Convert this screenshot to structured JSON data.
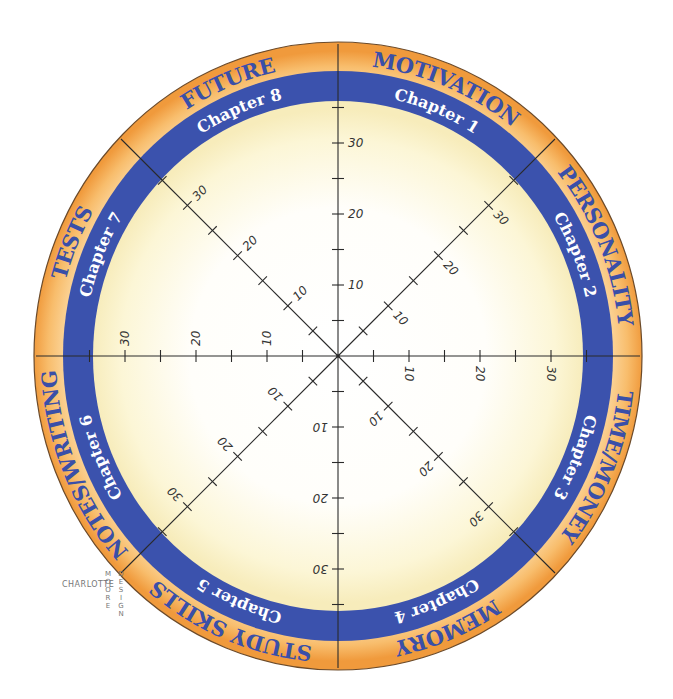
{
  "diagram": {
    "type": "wheel-of-life radar template",
    "center": [
      338,
      356
    ],
    "spokes": 8,
    "scale": {
      "min": 0,
      "max": 35,
      "major_step": 10,
      "minor_step": 5,
      "px_per_unit": 7.1
    },
    "tick_labels": [
      "10",
      "20",
      "30"
    ],
    "colors": {
      "rim_outer": "#f3a245",
      "rim_inner": "#fcd9a2",
      "band": "#3b52ad",
      "center": "#ffffff",
      "center_edge": "#faf1c4",
      "rim_text": "#3a4fa8",
      "band_text": "#ffffff",
      "axis": "#2a2a2a"
    },
    "sectors": [
      {
        "topic": "MOTIVATION",
        "chapter": "Chapter 1"
      },
      {
        "topic": "PERSONALITY",
        "chapter": "Chapter 2"
      },
      {
        "topic": "TIME/MONEY",
        "chapter": "Chapter 3"
      },
      {
        "topic": "MEMORY",
        "chapter": "Chapter 4"
      },
      {
        "topic": "STUDY SKILLS",
        "chapter": "Chapter 5"
      },
      {
        "topic": "NOTES/WRITING",
        "chapter": "Chapter 6"
      },
      {
        "topic": "TESTS",
        "chapter": "Chapter 7"
      },
      {
        "topic": "FUTURE",
        "chapter": "Chapter 8"
      }
    ]
  },
  "signature": {
    "first": "CHARLOTTE",
    "middle": "MOORE",
    "last": "DESIGN"
  }
}
